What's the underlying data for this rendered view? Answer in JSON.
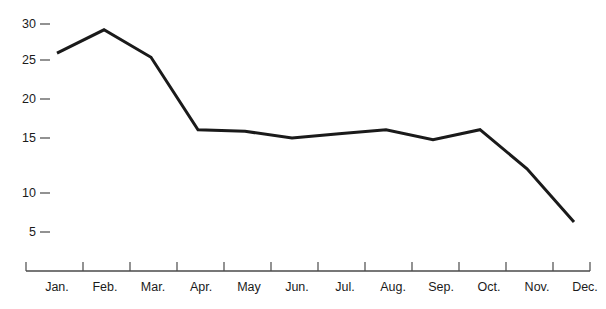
{
  "chart_data": {
    "type": "line",
    "title": "",
    "xlabel": "",
    "ylabel": "",
    "categories": [
      "Jan.",
      "Feb.",
      "Mar.",
      "Apr.",
      "May",
      "Jun.",
      "Jul.",
      "Aug.",
      "Sep.",
      "Oct.",
      "Nov.",
      "Dec."
    ],
    "values": [
      26.5,
      29.3,
      26.0,
      17.3,
      17.1,
      16.3,
      16.8,
      17.3,
      16.1,
      17.3,
      12.6,
      6.2
    ],
    "series": [
      {
        "name": "",
        "values": [
          26.5,
          29.3,
          26.0,
          17.3,
          17.1,
          16.3,
          16.8,
          17.3,
          16.1,
          17.3,
          12.6,
          6.2
        ]
      }
    ],
    "y_ticks": [
      30,
      25,
      20,
      15,
      10,
      5
    ],
    "y_tick_labels": [
      "30",
      "25",
      "20",
      "15",
      "10",
      "5"
    ],
    "ylim": [
      2.5,
      31.5
    ],
    "grid": false,
    "legend": false,
    "line_color": "#1a1a1a",
    "axis_color": "#4a4a4a",
    "background": "#ffffff"
  }
}
